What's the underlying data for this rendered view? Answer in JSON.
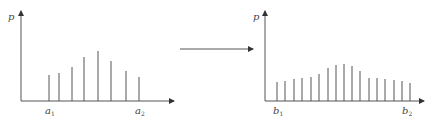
{
  "figure": {
    "left_chart": {
      "y_label": "p",
      "x_label_start": "a",
      "x_label_start_sub": "1",
      "x_label_end": "a",
      "x_label_end_sub": "2",
      "bars": [
        {
          "x": 49,
          "h": 26
        },
        {
          "x": 59,
          "h": 28
        },
        {
          "x": 72,
          "h": 34
        },
        {
          "x": 84,
          "h": 44
        },
        {
          "x": 98,
          "h": 50
        },
        {
          "x": 111,
          "h": 40
        },
        {
          "x": 126,
          "h": 30
        },
        {
          "x": 139,
          "h": 24
        }
      ]
    },
    "transform_arrow": {
      "from_x": 180,
      "to_x": 253,
      "y": 49
    },
    "right_chart": {
      "y_label": "p",
      "x_label_start": "b",
      "x_label_start_sub": "1",
      "x_label_end": "b",
      "x_label_end_sub": "2",
      "bars": [
        {
          "x": 277,
          "h": 19
        },
        {
          "x": 285,
          "h": 20
        },
        {
          "x": 294,
          "h": 22
        },
        {
          "x": 302,
          "h": 23
        },
        {
          "x": 311,
          "h": 24
        },
        {
          "x": 319,
          "h": 27
        },
        {
          "x": 328,
          "h": 33
        },
        {
          "x": 336,
          "h": 36
        },
        {
          "x": 344,
          "h": 37
        },
        {
          "x": 352,
          "h": 35
        },
        {
          "x": 360,
          "h": 30
        },
        {
          "x": 369,
          "h": 23
        },
        {
          "x": 377,
          "h": 23
        },
        {
          "x": 385,
          "h": 22
        },
        {
          "x": 394,
          "h": 21
        },
        {
          "x": 402,
          "h": 20
        },
        {
          "x": 410,
          "h": 18
        }
      ]
    },
    "colors": {
      "line": "#555555",
      "text": "#444444"
    }
  }
}
